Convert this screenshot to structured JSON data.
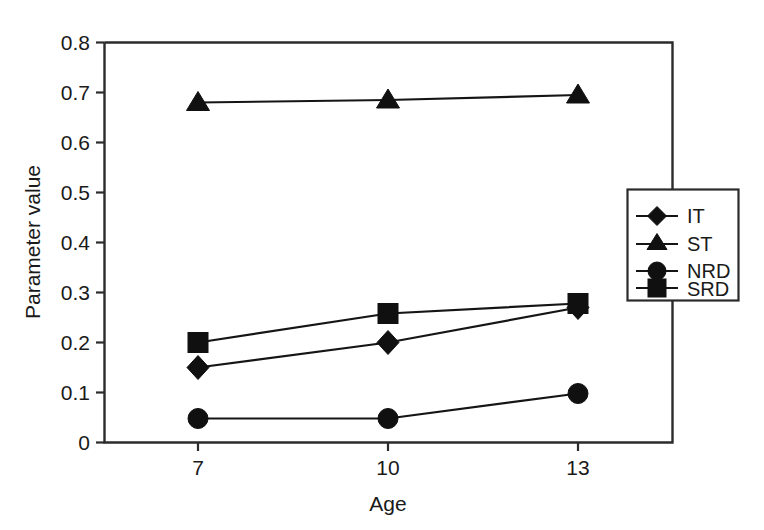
{
  "chart_data": {
    "type": "line",
    "title": "",
    "xlabel": "Age",
    "ylabel": "Parameter value",
    "x": [
      7,
      10,
      13
    ],
    "categories": [
      "7",
      "10",
      "13"
    ],
    "xtick_labels": [
      "7",
      "10",
      "13"
    ],
    "ytick_labels": [
      "0",
      "0.1",
      "0.2",
      "0.3",
      "0.4",
      "0.5",
      "0.6",
      "0.7",
      "0.8"
    ],
    "ytick_values": [
      0,
      0.1,
      0.2,
      0.3,
      0.4,
      0.5,
      0.6,
      0.7,
      0.8
    ],
    "ylim": [
      0,
      0.8
    ],
    "xlim": [
      5.6,
      14.6
    ],
    "grid": false,
    "legend_position": "right-middle-outside",
    "series": [
      {
        "name": "IT",
        "marker": "diamond",
        "values": [
          0.15,
          0.2,
          0.27
        ]
      },
      {
        "name": "ST",
        "marker": "triangle",
        "values": [
          0.68,
          0.685,
          0.695
        ]
      },
      {
        "name": "NRD",
        "marker": "circle",
        "values": [
          0.048,
          0.048,
          0.098
        ]
      },
      {
        "name": "SRD",
        "marker": "square",
        "values": [
          0.2,
          0.258,
          0.278
        ]
      }
    ],
    "colors": {
      "line": "#151515",
      "marker": "#101010",
      "axis": "#2b2b2b",
      "background": "#ffffff"
    }
  },
  "axes": {
    "y_title": "Parameter value",
    "x_title": "Age"
  },
  "legend": {
    "entries": [
      {
        "label": "IT",
        "marker": "diamond-marker-icon"
      },
      {
        "label": "ST",
        "marker": "triangle-marker-icon"
      },
      {
        "label": "NRD",
        "marker": "circle-marker-icon"
      },
      {
        "label": "SRD",
        "marker": "square-marker-icon"
      }
    ]
  }
}
